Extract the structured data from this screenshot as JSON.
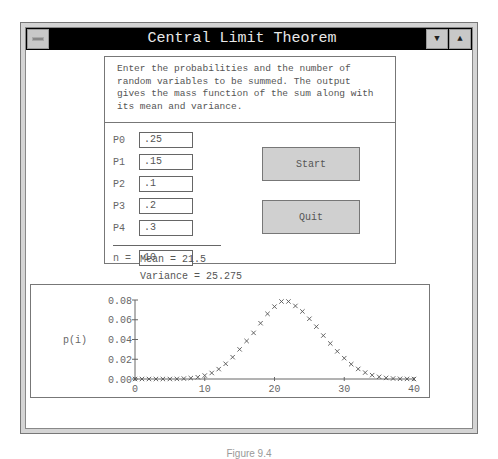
{
  "window": {
    "title": "Central Limit Theorem",
    "menu_button": "system-menu",
    "scroll_down_glyph": "▼",
    "scroll_up_glyph": "▲"
  },
  "intro": {
    "text": "Enter the probabilities and the number of random variables to be summed. The output gives the mass function of the sum along with its mean and variance."
  },
  "inputs": [
    {
      "label": "P0",
      "value": ".25"
    },
    {
      "label": "P1",
      "value": ".15"
    },
    {
      "label": "P2",
      "value": ".1"
    },
    {
      "label": "P3",
      "value": ".2"
    },
    {
      "label": "P4",
      "value": ".3"
    }
  ],
  "n_field": {
    "label": "n =",
    "value": "10"
  },
  "buttons": {
    "start": "Start",
    "quit": "Quit"
  },
  "stats": {
    "mean": "Mean = 21.5",
    "variance": "Variance = 25.275"
  },
  "chart_data": {
    "type": "scatter",
    "title": "",
    "xlabel": "i",
    "ylabel": "p(i)",
    "xlim": [
      0,
      40
    ],
    "ylim": [
      0,
      0.08
    ],
    "xticks": [
      "0",
      "10",
      "20",
      "30",
      "40"
    ],
    "yticks": [
      "0.00",
      "0.02",
      "0.04",
      "0.06",
      "0.08"
    ],
    "marker": "x",
    "grid": false,
    "x": [
      0,
      1,
      2,
      3,
      4,
      5,
      6,
      7,
      8,
      9,
      10,
      11,
      12,
      13,
      14,
      15,
      16,
      17,
      18,
      19,
      20,
      21,
      22,
      23,
      24,
      25,
      26,
      27,
      28,
      29,
      30,
      31,
      32,
      33,
      34,
      35,
      36,
      37,
      38,
      39,
      40
    ],
    "values": [
      0.0,
      0.0,
      0.0,
      0.0,
      0.0,
      0.0,
      0.0001,
      0.0004,
      0.0009,
      0.0018,
      0.0035,
      0.0061,
      0.01,
      0.0154,
      0.0221,
      0.03,
      0.0385,
      0.0467,
      0.0565,
      0.066,
      0.0733,
      0.0785,
      0.0785,
      0.074,
      0.0684,
      0.061,
      0.053,
      0.044,
      0.036,
      0.028,
      0.0211,
      0.015,
      0.0102,
      0.0065,
      0.0039,
      0.0022,
      0.0011,
      0.0005,
      0.0002,
      0.0001,
      0.0
    ]
  },
  "caption": "Figure 9.4"
}
